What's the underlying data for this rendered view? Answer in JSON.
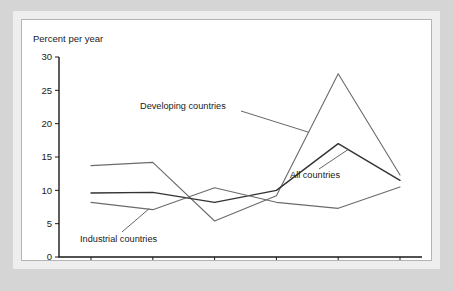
{
  "figure": {
    "background_color": "#d5d5d5",
    "card_background": "#ffffff",
    "border_color": "#b4b4b4"
  },
  "chart_data": {
    "type": "line",
    "title": "",
    "subtitle": "",
    "ylabel": "Percent per year",
    "xlabel": "",
    "ylim": [
      0,
      30
    ],
    "yticks": [
      0,
      5,
      10,
      15,
      20,
      25,
      30
    ],
    "ytick_labels": [
      "0",
      "5",
      "10",
      "15",
      "20",
      "25",
      "30"
    ],
    "grid": false,
    "legend_position": "inline-annotations",
    "categories": [
      "1962–1972",
      "1972–1982",
      "1982–1992",
      "1992–2002",
      "2002–2007",
      "2007–2009"
    ],
    "series": [
      {
        "name": "Developing countries",
        "color": "#6b6b6b",
        "width": 1.1,
        "values": [
          13.7,
          14.2,
          5.4,
          9.2,
          27.5,
          12.3
        ]
      },
      {
        "name": "All countries",
        "color": "#333333",
        "width": 1.4,
        "values": [
          9.6,
          9.7,
          8.2,
          10.0,
          17.0,
          11.5
        ]
      },
      {
        "name": "Industrial countries",
        "color": "#6b6b6b",
        "width": 1.1,
        "values": [
          8.2,
          7.1,
          10.4,
          8.2,
          7.3,
          10.5
        ]
      }
    ],
    "annotations": [
      {
        "text": "Developing countries",
        "series": "Developing countries"
      },
      {
        "text": "All countries",
        "series": "All countries"
      },
      {
        "text": "Industrial countries",
        "series": "Industrial countries"
      }
    ]
  }
}
